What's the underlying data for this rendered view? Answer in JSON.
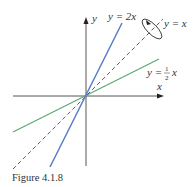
{
  "figure": {
    "caption": "Figure 4.1.8",
    "axes": {
      "x_label": "x",
      "y_label": "y"
    },
    "lines": [
      {
        "name": "y = 2x",
        "label": "y = 2x",
        "color": "#5b7fc9",
        "style": "solid"
      },
      {
        "name": "y = x",
        "label": "y = x",
        "color": "#333333",
        "style": "dashed"
      },
      {
        "name": "y = 1/2 x",
        "label_prefix": "y =",
        "label_num": "1",
        "label_den": "2",
        "label_suffix": "x",
        "color": "#5aa870",
        "style": "solid"
      }
    ],
    "annotation": "rotation-ellipse-arrow around y = x"
  }
}
